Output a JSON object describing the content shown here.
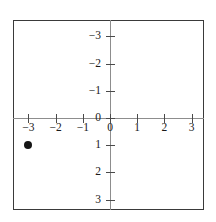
{
  "figure": {
    "title": "",
    "background_color": "#ffffff",
    "border_color": "#3a3a3a",
    "axis_color": "#8d8d8d",
    "point_color": "#151515"
  },
  "chart_data": {
    "type": "scatter",
    "title": "",
    "xlabel": "",
    "ylabel": "",
    "xlim": [
      -3.6,
      3.5
    ],
    "ylim": [
      -3.6,
      3.6
    ],
    "grid": false,
    "legend": null,
    "x_ticks": [
      -3,
      -2,
      -1,
      0,
      1,
      2,
      3
    ],
    "y_ticks": [
      -3,
      -2,
      -1,
      0,
      1,
      2,
      3
    ],
    "x_tick_labels": [
      "−3",
      "−2",
      "−1",
      "0",
      "1",
      "2",
      "3"
    ],
    "y_tick_labels": [
      "3",
      "2",
      "1",
      "0",
      "−1",
      "−2",
      "−3"
    ],
    "series": [
      {
        "name": "point",
        "marker": "filled-circle",
        "points": [
          {
            "x": -3,
            "y": -1,
            "label": "(−3, −1)"
          }
        ]
      }
    ]
  }
}
